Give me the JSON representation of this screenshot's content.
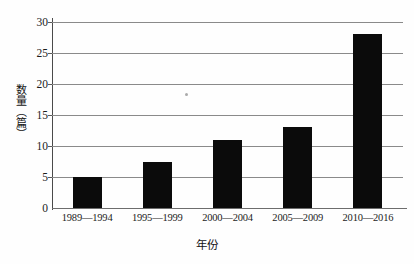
{
  "chart_data": {
    "type": "bar",
    "title": "",
    "categories": [
      "1989—1994",
      "1995—1999",
      "2000—2004",
      "2005—2009",
      "2010—2016"
    ],
    "values": [
      5,
      7.5,
      11,
      13,
      28
    ],
    "series": [
      {
        "name": "数量（篇）",
        "values": [
          5,
          7.5,
          11,
          13,
          28
        ]
      }
    ],
    "xlabel": "年份",
    "ylabel": "数量（篇）",
    "ylim": [
      0,
      30
    ],
    "yticks": [
      0,
      5,
      10,
      15,
      20,
      25,
      30
    ],
    "ytick_labels": [
      "0",
      "5",
      "10",
      "15",
      "20",
      "25",
      "30"
    ],
    "grid": true,
    "grid_axis": "y",
    "legend": false,
    "legend_position": "none",
    "bar_color": "#0b0b0b",
    "gridline_color": "#8a8a8a",
    "axis_color": "#4a4a4a",
    "background_color": "#fefefe",
    "annotations": [
      {
        "name": "scan-speck",
        "text": "",
        "x_px": 133,
        "y_px": 71
      }
    ]
  }
}
